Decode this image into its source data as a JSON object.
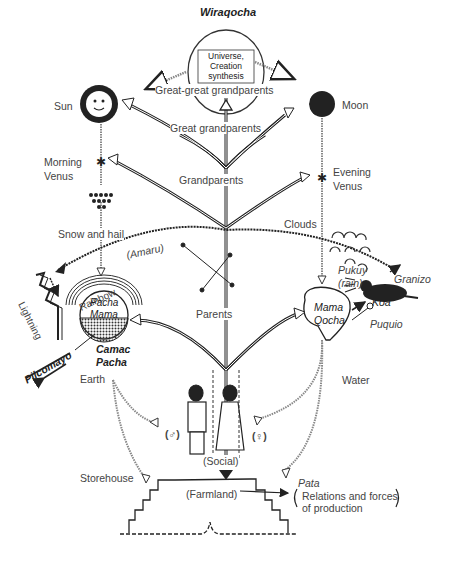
{
  "diagram": {
    "top": {
      "title": "Wiraqocha",
      "box_lines": [
        "Universe,",
        "Creation",
        "synthesis"
      ]
    },
    "generations": {
      "great_great": "Great-great grandparents",
      "great": "Great grandparents",
      "grand": "Grandparents",
      "parents": "Parents",
      "social": "(Social)",
      "farmland": "(Farmland)"
    },
    "left": {
      "sun": "Sun",
      "morning_venus_1": "Morning",
      "morning_venus_2": "Venus",
      "snow_hail": "Snow and hail",
      "amaru": "(Amaru)",
      "lightning": "Lightning",
      "rainbow": "Rainbow",
      "pacha_mama_1": "Pacha",
      "pacha_mama_2": "Mama",
      "camac_1": "Camac",
      "camac_2": "Pacha",
      "pilcomayo": "Pilcomayo",
      "earth": "Earth",
      "storehouse": "Storehouse",
      "male_symbol": "(♂)"
    },
    "right": {
      "moon": "Moon",
      "evening_venus_1": "Evening",
      "evening_venus_2": "Venus",
      "clouds": "Clouds",
      "pukuy_1": "Pukuy",
      "pukuy_2": "(rain)",
      "granizo": "Granizo",
      "koa": "Koa",
      "mama_qocha_1": "Mama",
      "mama_qocha_2": "Qocha",
      "puquio": "Puquio",
      "water": "Water",
      "female_symbol": "(♀)",
      "pata": "Pata",
      "relations_1": "Relations and forces",
      "relations_2": "of production"
    }
  }
}
